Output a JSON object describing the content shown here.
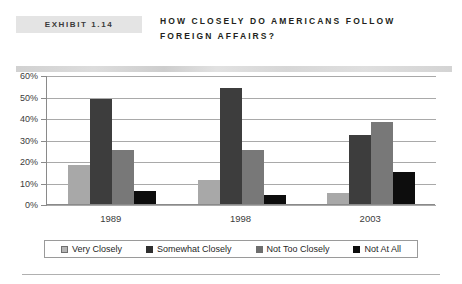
{
  "header": {
    "exhibit_tag": "EXHIBIT 1.14",
    "title": "HOW CLOSELY DO AMERICANS FOLLOW FOREIGN AFFAIRS?"
  },
  "chart_data": {
    "type": "bar",
    "title": "HOW CLOSELY DO AMERICANS FOLLOW FOREIGN AFFAIRS?",
    "xlabel": "",
    "ylabel": "",
    "categories": [
      "1989",
      "1998",
      "2003"
    ],
    "series": [
      {
        "name": "Very Closely",
        "values": [
          18,
          11,
          5
        ],
        "color": "#a8a8a8"
      },
      {
        "name": "Somewhat Closely",
        "values": [
          49,
          54,
          32
        ],
        "color": "#3d3d3d"
      },
      {
        "name": "Not Too Closely",
        "values": [
          25,
          25,
          38
        ],
        "color": "#787878"
      },
      {
        "name": "Not At All",
        "values": [
          6,
          4,
          15
        ],
        "color": "#0d0d0d"
      }
    ],
    "ylim": [
      0,
      60
    ],
    "yticks": [
      "0%",
      "10%",
      "20%",
      "30%",
      "40%",
      "50%",
      "60%"
    ],
    "ytick_values": [
      0,
      10,
      20,
      30,
      40,
      50,
      60
    ],
    "grid": true,
    "legend_position": "bottom"
  }
}
